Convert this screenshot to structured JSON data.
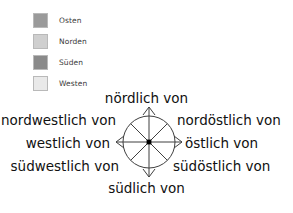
{
  "legend": {
    "items": [
      {
        "label": "Osten",
        "color": "#9a9a9a",
        "swatch_name": "legend-swatch-osten"
      },
      {
        "label": "Norden",
        "color": "#cfcfcf",
        "swatch_name": "legend-swatch-norden"
      },
      {
        "label": "Süden",
        "color": "#8a8a8a",
        "swatch_name": "legend-swatch-sueden"
      },
      {
        "label": "Westen",
        "color": "#e9e9e9",
        "swatch_name": "legend-swatch-westen"
      }
    ]
  },
  "compass": {
    "north": "nördlich von",
    "northeast": "nordöstlich von",
    "east": "östlich von",
    "southeast": "südöstlich von",
    "south": "südlich von",
    "southwest": "südwestlich von",
    "west": "westlich von",
    "northwest": "nordwestlich von",
    "line_color": "#3f3f3f",
    "center_dot_color": "#000000"
  }
}
